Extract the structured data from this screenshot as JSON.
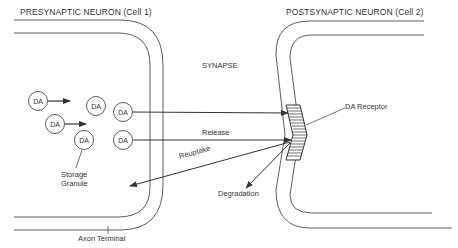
{
  "labels": {
    "presynaptic": "PRESYNAPTIC NEURON (Cell 1)",
    "postsynaptic": "POSTSYNAPTIC NEURON (Cell 2)",
    "synapse": "SYNAPSE",
    "receptor": "DA Receptor",
    "release": "Release",
    "reuptake": "Reuptake",
    "degradation": "Degradation",
    "storage_line1": "Storage",
    "storage_line2": "Granule",
    "axon_terminal": "Axon Terminal"
  },
  "molecule_label": "DA",
  "molecules": [
    {
      "cx": 38,
      "cy": 101
    },
    {
      "cx": 96,
      "cy": 106
    },
    {
      "cx": 123,
      "cy": 112
    },
    {
      "cx": 55,
      "cy": 124
    },
    {
      "cx": 84,
      "cy": 140
    },
    {
      "cx": 123,
      "cy": 140
    }
  ],
  "colors": {
    "line": "#333333",
    "background": "#ffffff"
  }
}
